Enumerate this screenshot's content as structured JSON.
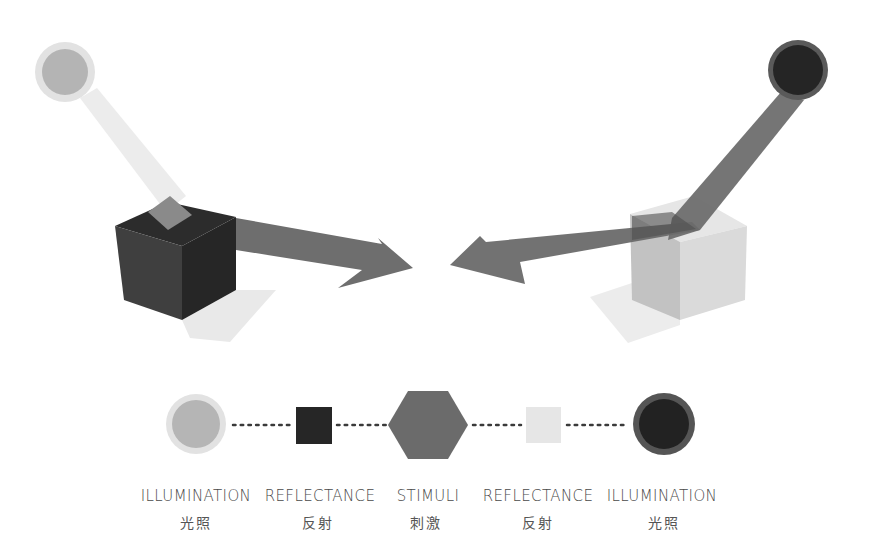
{
  "colors": {
    "light_illum": "#b3b3b3",
    "light_illum_halo": "#dcdcdc",
    "dark_illum": "#2a2a2a",
    "dark_illum_ring": "#5a5a5a",
    "dark_reflect": "#2b2b2b",
    "light_reflect": "#e6e6e6",
    "stimuli": "#6b6b6b",
    "arrow": "#6e6e6e",
    "light_beam": "#ececec",
    "dot": "#3a3a3a"
  },
  "diagram": {
    "left_scene": {
      "illumination": "light",
      "reflectance": "dark",
      "result": "stimuli"
    },
    "right_scene": {
      "illumination": "dark",
      "reflectance": "light",
      "result": "stimuli"
    }
  },
  "legend": {
    "items": [
      {
        "en": "ILLUMINATION",
        "zh": "光照",
        "shape": "light-circle",
        "x": 196
      },
      {
        "en": "REFLECTANCE",
        "zh": "反射",
        "shape": "dark-square",
        "x": 313
      },
      {
        "en": "STIMULI",
        "zh": "刺激",
        "shape": "hexagon",
        "x": 428
      },
      {
        "en": "REFLECTANCE",
        "zh": "反射",
        "shape": "light-square",
        "x": 543
      },
      {
        "en": "ILLUMINATION",
        "zh": "光照",
        "shape": "dark-circle",
        "x": 664
      }
    ]
  }
}
